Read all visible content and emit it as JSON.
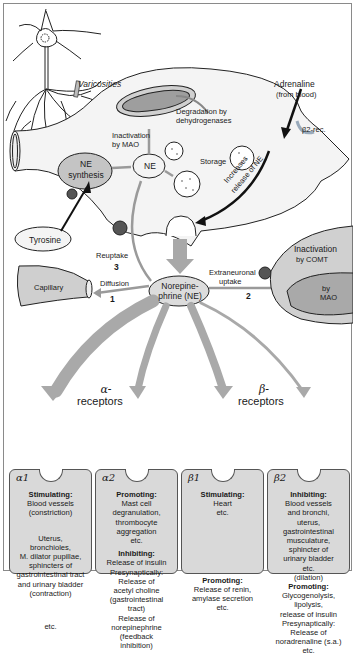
{
  "diagram": {
    "labels": {
      "varicosities": "Varicosities",
      "adrenaline": "Adrenaline",
      "adrenaline_source": "(from blood)",
      "beta2_rec": "β2-rec.",
      "degradation": "Degradation by",
      "degradation2": "dehydrogenases",
      "inactivation_mao": "Inactivation",
      "inactivation_mao2": "by MAO",
      "ne_synthesis": "NE",
      "ne_synthesis2": "synthesis",
      "ne": "NE",
      "storage": "Storage",
      "increases_release": "Increases",
      "increases_release2": "release of NE",
      "tyrosine": "Tyrosine",
      "reuptake": "Reuptake",
      "reuptake_num": "3",
      "capillary": "Capillary",
      "diffusion": "Diffusion",
      "diffusion_num": "1",
      "norepinephrine": "Norepine-",
      "norepinephrine2": "phrine (NE)",
      "extraneuronal": "Extraneuronal",
      "extraneuronal2": "uptake",
      "extraneuronal_num": "2",
      "inactivation_comt": "Inactivation",
      "inactivation_comt2": "by COMT",
      "by_mao": "by",
      "by_mao2": "MAO",
      "alpha_receptors": "α-",
      "alpha_receptors2": "receptors",
      "beta_receptors": "β-",
      "beta_receptors2": "receptors"
    },
    "receptors": [
      {
        "symbol": "α1",
        "sections": [
          {
            "title": "Stimulating:",
            "lines": [
              "Blood vessels",
              "(constriction)"
            ]
          },
          {
            "title": "",
            "lines": [
              "Uterus,",
              "bronchioles,",
              "M. dilator pupillae,",
              "sphincters of",
              "gastrointestinal tract",
              "and urinary bladder",
              "(contraction)"
            ]
          },
          {
            "title": "",
            "lines": [
              "etc."
            ]
          }
        ]
      },
      {
        "symbol": "α2",
        "sections": [
          {
            "title": "Promoting:",
            "lines": [
              "Mast cell",
              "degranulation,",
              "thrombocyte",
              "aggregation",
              "etc."
            ]
          },
          {
            "title": "Inhibiting:",
            "lines": [
              "Release of insulin",
              "Presynaptically:",
              "Release of",
              "acetyl choline",
              "(gastrointestinal",
              "tract)",
              "Release of",
              "norepinephrine",
              "(feedback",
              "inhibition)"
            ]
          }
        ]
      },
      {
        "symbol": "β1",
        "sections": [
          {
            "title": "Stimulating:",
            "lines": [
              "Heart",
              "etc."
            ]
          },
          {
            "title": "Promoting:",
            "lines": [
              "Release of renin,",
              "amylase secretion",
              "etc."
            ]
          }
        ]
      },
      {
        "symbol": "β2",
        "sections": [
          {
            "title": "Inhibiting:",
            "lines": [
              "Blood vessels",
              "and bronchi,",
              "uterus,",
              "gastrointestinal",
              "musculature,",
              "sphincter of",
              "urinary bladder",
              "etc.",
              "(dilation)"
            ]
          },
          {
            "title": "Promoting:",
            "lines": [
              "Glycogenolysis,",
              "lipolysis,",
              "release of insulin",
              "Presynaptically:",
              "Release of",
              "noradrenaline (s.a.)",
              "etc."
            ]
          }
        ]
      }
    ],
    "colors": {
      "cell_fill": "#f4f4f4",
      "gray_fill": "#c8c8c8",
      "arrow_gray": "#9a9a9a",
      "box_fill": "#d9d9d9",
      "transporter": "#555555"
    }
  }
}
